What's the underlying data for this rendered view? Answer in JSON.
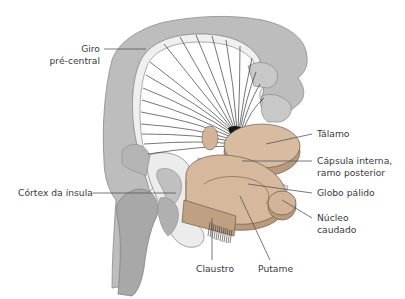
{
  "diagram": {
    "colors": {
      "cortex_gray": "#b8b8b8",
      "cortex_dark": "#9e9e9e",
      "white_matter_rim": "#eeeeee",
      "nucleus_tan": "#d6b89c",
      "nucleus_dark": "#b89a7e",
      "fibers": "#1a1a1a",
      "leader_line": "#555555",
      "label_text": "#3a3a3a"
    },
    "labels": {
      "giro_line1": "Giro",
      "giro_line2": "pré-central",
      "talamo": "Tálamo",
      "capsula_line1": "Cápsula interna,",
      "capsula_line2": "ramo posterior",
      "globo": "Globo pálido",
      "nucleo_line1": "Núcleo",
      "nucleo_line2": "caudado",
      "cortex_insula": "Córtex da ínsula",
      "claustro": "Claustro",
      "putame": "Putame"
    }
  }
}
